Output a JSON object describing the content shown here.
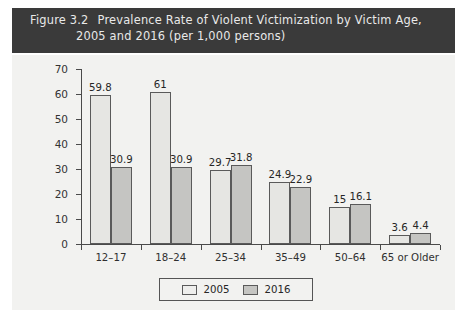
{
  "header": {
    "figure_number": "Figure 3.2",
    "title_line_1": "Prevalence Rate of Violent Victimization by Victim Age,",
    "title_line_2": "2005 and 2016 (per 1,000 persons)",
    "band_color": "#3a3a3a",
    "text_color": "#e9e9e9"
  },
  "chart_data": {
    "type": "bar",
    "xlabel": "",
    "ylabel": "",
    "ylim": [
      0,
      70
    ],
    "yticks": [
      0,
      10,
      20,
      30,
      40,
      50,
      60,
      70
    ],
    "ytick_labels": [
      "0",
      "10",
      "20",
      "30",
      "40",
      "50",
      "60",
      "70"
    ],
    "grid": false,
    "legend_position": "bottom-center",
    "categories": [
      "12–17",
      "18–24",
      "25–34",
      "35–49",
      "50–64",
      "65 or Older"
    ],
    "series": [
      {
        "name": "2005",
        "color": "#e6e6e3",
        "values": [
          59.8,
          61,
          29.7,
          24.9,
          15,
          3.6
        ],
        "labels": [
          "59.8",
          "61",
          "29.7",
          "24.9",
          "15",
          "3.6"
        ]
      },
      {
        "name": "2016",
        "color": "#c5c5c2",
        "values": [
          30.9,
          30.9,
          31.8,
          22.9,
          16.1,
          4.4
        ],
        "labels": [
          "30.9",
          "30.9",
          "31.8",
          "22.9",
          "16.1",
          "4.4"
        ]
      }
    ]
  },
  "legend": {
    "items": [
      {
        "label": "2005",
        "swatch": "#eeeeec"
      },
      {
        "label": "2016",
        "swatch": "#c5c5c2"
      }
    ]
  }
}
